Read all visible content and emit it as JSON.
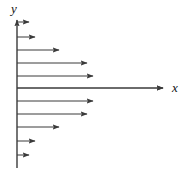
{
  "figure": {
    "type": "vector-field-diagram",
    "background_color": "#ffffff",
    "stroke_color": "#3a3a3a",
    "label_color": "#111111",
    "width": 184,
    "height": 181
  },
  "axes": {
    "x_axis": {
      "label": "x",
      "label_x": 172,
      "label_y": 92,
      "y": 88,
      "x_start": 17,
      "x_end": 163,
      "arrowhead": true
    },
    "y_axis": {
      "label": "y",
      "label_x": 11,
      "label_y": 13,
      "x": 17,
      "y_start": 168,
      "y_end": 20,
      "arrowhead": true
    }
  },
  "chart_data": {
    "type": "vector-field",
    "title": "",
    "xlabel": "x",
    "ylabel": "y",
    "grid": false,
    "legend": null,
    "origin": {
      "x": 17,
      "y": 88
    },
    "vector_count": 11,
    "direction": "+x",
    "symmetry": "symmetric about the x-axis",
    "vectors": [
      {
        "index": 1,
        "y": 22,
        "tail_x": 17,
        "tip_x": 29,
        "length": 12
      },
      {
        "index": 2,
        "y": 37,
        "tail_x": 17,
        "tip_x": 35,
        "length": 18
      },
      {
        "index": 3,
        "y": 50,
        "tail_x": 17,
        "tip_x": 59,
        "length": 42
      },
      {
        "index": 4,
        "y": 63,
        "tail_x": 17,
        "tip_x": 87,
        "length": 70
      },
      {
        "index": 5,
        "y": 76,
        "tail_x": 17,
        "tip_x": 93,
        "length": 76
      },
      {
        "index": 6,
        "y": 88,
        "tail_x": 17,
        "tip_x": 163,
        "length": 146
      },
      {
        "index": 7,
        "y": 101,
        "tail_x": 17,
        "tip_x": 93,
        "length": 76
      },
      {
        "index": 8,
        "y": 114,
        "tail_x": 17,
        "tip_x": 87,
        "length": 70
      },
      {
        "index": 9,
        "y": 127,
        "tail_x": 17,
        "tip_x": 59,
        "length": 42
      },
      {
        "index": 10,
        "y": 141,
        "tail_x": 17,
        "tip_x": 35,
        "length": 18
      },
      {
        "index": 11,
        "y": 155,
        "tail_x": 17,
        "tip_x": 29,
        "length": 12
      }
    ]
  }
}
